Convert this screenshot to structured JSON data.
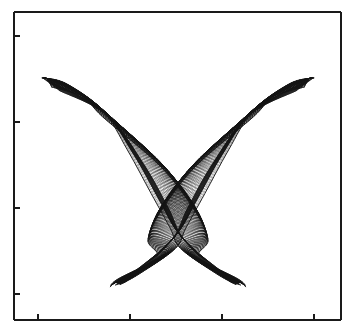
{
  "figure": {
    "title": "",
    "background_color": "#ffffff",
    "line_color": "#141414",
    "axis_color": "#1a1a1a"
  },
  "axes": {
    "frame": {
      "left": 14,
      "top": 12,
      "right": 341,
      "bottom": 320
    },
    "frame_line_width": 1.4,
    "spines_visible": {
      "left": true,
      "bottom": true,
      "top": true,
      "right": true
    },
    "tick_direction": "in",
    "tick_length": 6,
    "x_ticks": {
      "pixels": [
        38,
        130,
        222,
        314
      ],
      "labels": [
        "",
        "",
        "",
        ""
      ]
    },
    "y_ticks": {
      "pixels": [
        36,
        122,
        208,
        294
      ],
      "labels": [
        "",
        "",
        "",
        ""
      ]
    },
    "xlabel": "",
    "ylabel": ""
  },
  "chart_data": {
    "type": "line",
    "title": "",
    "subtitle": "",
    "xlabel": "",
    "ylabel": "",
    "grid": false,
    "legend_position": "none",
    "legend": [],
    "annotations": [],
    "xlim": [
      0,
      1
    ],
    "ylim": [
      0,
      1
    ],
    "n_curves": 120,
    "series": [
      {
        "name": "left-wing-family",
        "x": [
          0.07,
          0.12,
          0.2,
          0.29,
          0.38,
          0.455,
          0.52,
          0.575,
          0.61
        ],
        "y": [
          0.79,
          0.775,
          0.735,
          0.64,
          0.52,
          0.4,
          0.3,
          0.215,
          0.16
        ]
      },
      {
        "name": "right-wing-family",
        "x": [
          0.93,
          0.88,
          0.8,
          0.71,
          0.62,
          0.545,
          0.48,
          0.425,
          0.39
        ],
        "y": [
          0.79,
          0.775,
          0.735,
          0.64,
          0.52,
          0.4,
          0.3,
          0.215,
          0.16
        ]
      },
      {
        "name": "left-lower-tip",
        "x": [
          0.3,
          0.345,
          0.4,
          0.455,
          0.5
        ],
        "y": [
          0.11,
          0.14,
          0.185,
          0.24,
          0.29
        ]
      },
      {
        "name": "right-lower-tip",
        "x": [
          0.7,
          0.655,
          0.6,
          0.545,
          0.5
        ],
        "y": [
          0.11,
          0.14,
          0.185,
          0.24,
          0.29
        ]
      }
    ],
    "key_points": {
      "left_wing_tip": [
        0.07,
        0.79
      ],
      "right_wing_tip": [
        0.93,
        0.79
      ],
      "left_waist": [
        0.265,
        0.69
      ],
      "right_waist": [
        0.735,
        0.69
      ],
      "crossing_center": [
        0.5,
        0.295
      ],
      "left_lower_tip": [
        0.3,
        0.105
      ],
      "right_lower_tip": [
        0.7,
        0.105
      ]
    }
  }
}
